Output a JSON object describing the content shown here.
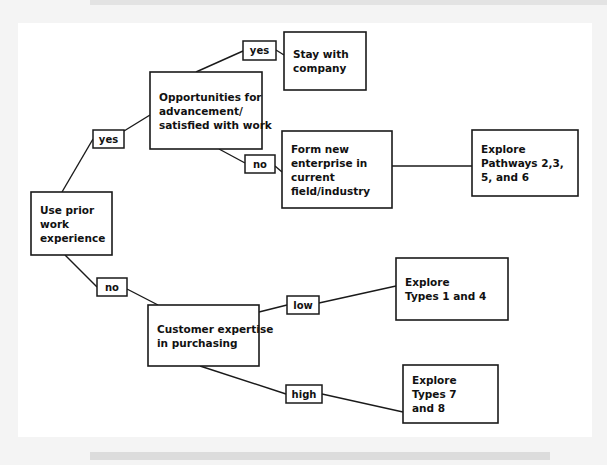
{
  "page": {
    "background_color": "#f4f4f4",
    "paper_color": "#ffffff",
    "line_color": "#1a1a1a"
  },
  "diagram": {
    "type": "decision-tree",
    "title": "",
    "nodes": [
      {
        "id": "use-prior-work-experience",
        "lines": [
          "Use prior",
          "work",
          "experience"
        ],
        "x": 31,
        "y": 192,
        "w": 81,
        "h": 63
      },
      {
        "id": "opportunities-for-advancement",
        "lines": [
          "Opportunities for",
          "advancement/",
          "satisfied with work"
        ],
        "x": 150,
        "y": 72,
        "w": 112,
        "h": 77
      },
      {
        "id": "stay-with-company",
        "lines": [
          "Stay with",
          "company"
        ],
        "x": 284,
        "y": 32,
        "w": 82,
        "h": 58
      },
      {
        "id": "form-new-enterprise",
        "lines": [
          "Form new",
          "enterprise in",
          "current",
          "field/industry"
        ],
        "x": 282,
        "y": 131,
        "w": 110,
        "h": 77
      },
      {
        "id": "explore-pathways",
        "lines": [
          "Explore",
          "Pathways 2,3,",
          "5, and 6"
        ],
        "x": 472,
        "y": 130,
        "w": 106,
        "h": 66
      },
      {
        "id": "customer-expertise-in-purchasing",
        "lines": [
          "Customer expertise",
          "in purchasing"
        ],
        "x": 148,
        "y": 305,
        "w": 111,
        "h": 61
      },
      {
        "id": "explore-types-1-and-4",
        "lines": [
          "Explore",
          "Types 1 and 4"
        ],
        "x": 396,
        "y": 258,
        "w": 112,
        "h": 62
      },
      {
        "id": "explore-types-7-and-8",
        "lines": [
          "Explore",
          "Types 7",
          "and 8"
        ],
        "x": 403,
        "y": 365,
        "w": 95,
        "h": 58
      }
    ],
    "edge_labels": [
      {
        "id": "yes-advancement",
        "text": "yes",
        "x": 93,
        "y": 130,
        "w": 31,
        "h": 18
      },
      {
        "id": "yes-stay",
        "text": "yes",
        "x": 243,
        "y": 41,
        "w": 33,
        "h": 19
      },
      {
        "id": "no-form-enterprise",
        "text": "no",
        "x": 245,
        "y": 155,
        "w": 30,
        "h": 18
      },
      {
        "id": "no-customer-expertise",
        "text": "no",
        "x": 97,
        "y": 278,
        "w": 30,
        "h": 18
      },
      {
        "id": "low-types-1-4",
        "text": "low",
        "x": 287,
        "y": 296,
        "w": 32,
        "h": 18
      },
      {
        "id": "high-types-7-8",
        "text": "high",
        "x": 286,
        "y": 385,
        "w": 36,
        "h": 18
      }
    ],
    "connectors": [
      {
        "id": "edge-root-to-yes",
        "points": "93,139 62,192"
      },
      {
        "id": "edge-yes-to-opportunities",
        "points": "124,131 150,115"
      },
      {
        "id": "edge-opportunities-to-yes-stay",
        "points": "196,72 243,51"
      },
      {
        "id": "edge-yes-to-stay-company",
        "points": "276,50 284,55"
      },
      {
        "id": "edge-opportunities-to-no",
        "points": "219,149 245,163"
      },
      {
        "id": "edge-no-to-form-enterprise",
        "points": "275,166 282,172"
      },
      {
        "id": "edge-form-enterprise-to-pathways",
        "points": "392,166 472,166"
      },
      {
        "id": "edge-root-to-no-lower",
        "points": "65,255 97,287"
      },
      {
        "id": "edge-no-to-customer-expertise",
        "points": "127,289 158,305"
      },
      {
        "id": "edge-customer-to-low",
        "points": "259,312 287,305"
      },
      {
        "id": "edge-low-to-types-1-4",
        "points": "319,303 396,286"
      },
      {
        "id": "edge-customer-to-high",
        "points": "200,366 286,394"
      },
      {
        "id": "edge-high-to-types-7-8",
        "points": "322,394 403,412"
      }
    ]
  }
}
